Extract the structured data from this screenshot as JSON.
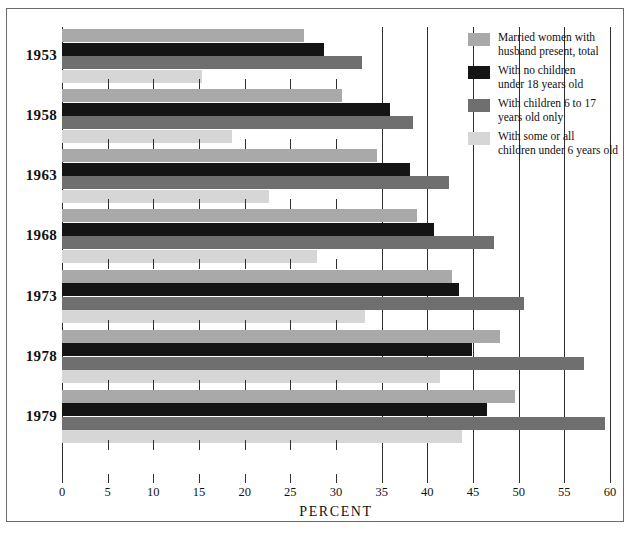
{
  "chart_data": {
    "type": "bar",
    "orientation": "horizontal",
    "title": "",
    "xlabel": "PERCENT",
    "ylabel": "",
    "xlim": [
      0,
      60
    ],
    "xticks": [
      0,
      5,
      10,
      15,
      20,
      25,
      30,
      35,
      40,
      45,
      50,
      55,
      60
    ],
    "gridlines": [
      35,
      40,
      45,
      50,
      55,
      60
    ],
    "grid": true,
    "legend_position": "top-right",
    "categories": [
      "1953",
      "1958",
      "1963",
      "1968",
      "1973",
      "1978",
      "1979"
    ],
    "series": [
      {
        "name": "Married women with husband present, total",
        "color": "#a9a9a9",
        "values": [
          26.5,
          30.7,
          34.5,
          38.9,
          42.7,
          48.0,
          49.6
        ]
      },
      {
        "name": "With no children under 18 years old",
        "color": "#141414",
        "values": [
          28.7,
          35.9,
          38.1,
          40.7,
          43.5,
          44.9,
          46.5
        ]
      },
      {
        "name": "With children 6 to 17 years old only",
        "color": "#6f6f6f",
        "values": [
          32.9,
          38.4,
          42.4,
          47.3,
          50.6,
          57.2,
          59.4
        ]
      },
      {
        "name": "With some or all children under 6 years old",
        "color": "#d6d6d6",
        "values": [
          15.3,
          18.6,
          22.7,
          27.9,
          33.2,
          41.4,
          43.8
        ]
      }
    ]
  },
  "legend": {
    "items": [
      {
        "label_line1": "Married women with",
        "label_line2": "husband present, total",
        "color": "#a9a9a9"
      },
      {
        "label_line1": "With no children",
        "label_line2": "under 18 years old",
        "color": "#141414"
      },
      {
        "label_line1": "With children 6 to 17",
        "label_line2": "years old only",
        "color": "#6f6f6f"
      },
      {
        "label_line1": "With some or all",
        "label_line2": "children under 6 years old",
        "color": "#d6d6d6"
      }
    ]
  },
  "axis": {
    "title": "PERCENT",
    "tick_labels": [
      "0",
      "5",
      "10",
      "15",
      "20",
      "25",
      "30",
      "35",
      "40",
      "45",
      "50",
      "55",
      "60"
    ]
  }
}
